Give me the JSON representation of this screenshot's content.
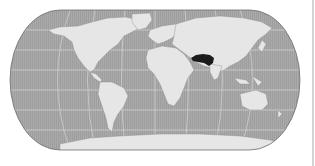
{
  "map": {
    "projection": "robinson-like world map",
    "ocean_color": "#a8a8a8",
    "land_color": "#e6e6e6",
    "graticule_color": "#d2d2d2",
    "border_color": "#707070",
    "highlight": {
      "region": "Iran / Afghanistan / Pakistan",
      "color": "#1c1c1c"
    }
  }
}
